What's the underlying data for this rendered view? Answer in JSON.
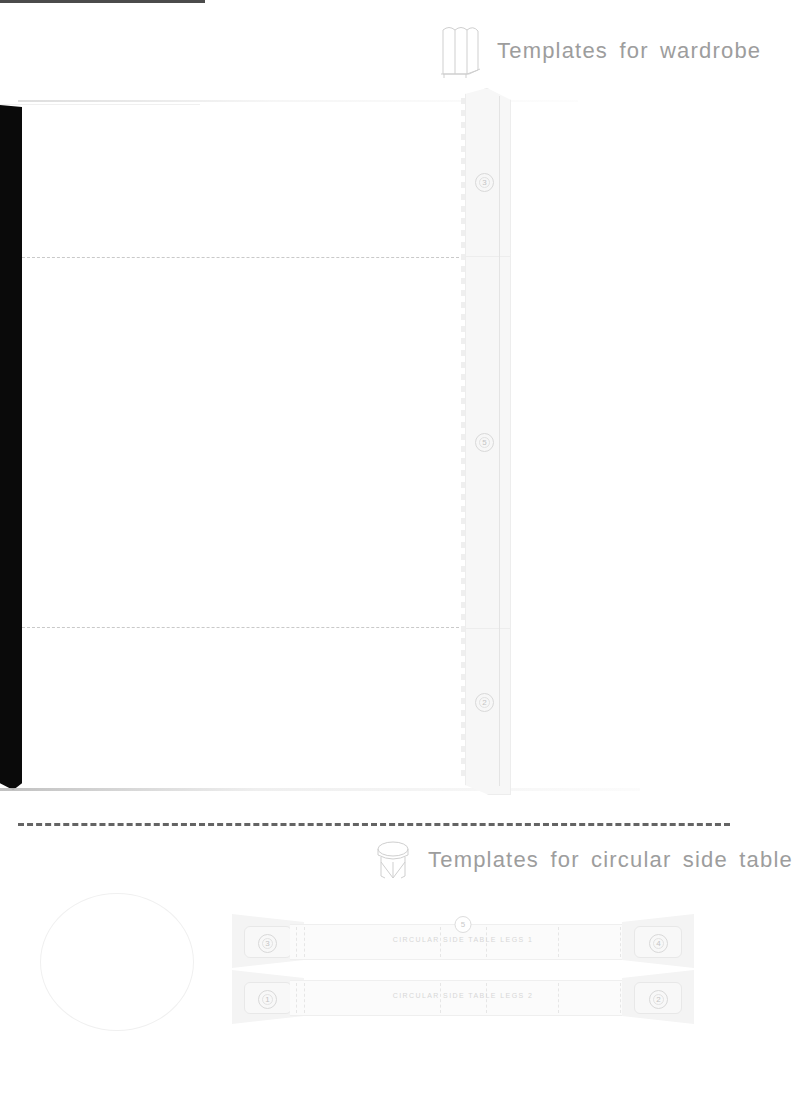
{
  "document": {
    "type": "papercraft-template-sheet",
    "sections": [
      {
        "title": "Templates for wardrobe",
        "icon": "wardrobe-icon"
      },
      {
        "title": "Templates for circular side table",
        "icon": "side-table-icon"
      }
    ]
  },
  "wardrobe_section": {
    "heading": "Templates for wardrobe",
    "icon_name": "wardrobe-icon",
    "strip_markers": [
      "3",
      "5",
      "2"
    ],
    "fold_lines": 2
  },
  "table_section": {
    "heading": "Templates for circular side table",
    "icon_name": "side-table-icon",
    "circle_name": "circular-table-top-outline",
    "leg_strips": [
      {
        "label": "CIRCULAR SIDE TABLE LEGS 1",
        "left_tab": "3",
        "right_tab": "4",
        "center_marker": "5"
      },
      {
        "label": "CIRCULAR SIDE TABLE LEGS 2",
        "left_tab": "1",
        "right_tab": "2",
        "center_marker": ""
      }
    ]
  },
  "colors": {
    "heading_text": "#9d9d9d",
    "paper": "#ffffff",
    "line_light": "#ededed",
    "fold_dash": "#c9c9c9",
    "cut_dash": "#4a4a4a",
    "scan_edge": "#0a0a0a"
  }
}
